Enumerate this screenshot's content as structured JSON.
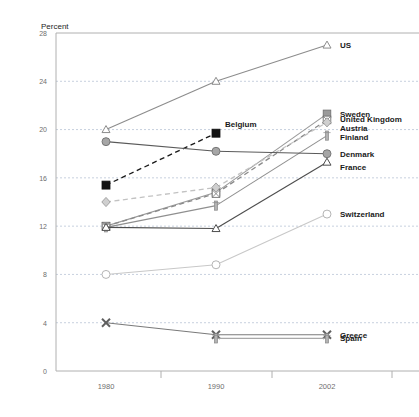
{
  "chart_data": {
    "type": "line",
    "title": "",
    "subtitle": "",
    "xlabel": "",
    "ylabel": "Percent",
    "ylabel_text": "Percent",
    "x": [
      "1980",
      "1990",
      "2002"
    ],
    "categories": [
      "1980",
      "1990",
      "2002"
    ],
    "xtick_labels": [
      "1980",
      "1990",
      "2002"
    ],
    "ytick_labels": [
      "0",
      "4",
      "8",
      "12",
      "16",
      "20",
      "24",
      "28"
    ],
    "ytick_values": [
      0,
      4,
      8,
      12,
      16,
      20,
      24,
      28
    ],
    "ylim": [
      0,
      28
    ],
    "grid": "horizontal-dashed",
    "legend_position": "right-inline",
    "series": [
      {
        "name": "US",
        "label": "US",
        "values": [
          20.0,
          24.0,
          27.0
        ],
        "marker": "triangle-open",
        "line_style": "solid",
        "color": "#8c8c8c",
        "label_y": 27.0
      },
      {
        "name": "Sweden",
        "label": "Sweden",
        "values": [
          12.0,
          14.8,
          21.3
        ],
        "marker": "square-filled",
        "line_style": "solid",
        "color": "#9a9a9a",
        "label_y": 21.3
      },
      {
        "name": "United Kingdom",
        "label": "United Kingdom",
        "values": [
          12.0,
          14.7,
          20.8
        ],
        "marker": "square-crossed",
        "line_style": "dashed",
        "color": "#8a8a8a",
        "label_y": 20.9
      },
      {
        "name": "Austria",
        "label": "Austria",
        "values": [
          14.0,
          15.2,
          20.6
        ],
        "marker": "diamond",
        "line_style": "dashed",
        "color": "#c2c2c2",
        "label_y": 20.0
      },
      {
        "name": "Finland",
        "label": "Finland",
        "values": [
          11.9,
          13.7,
          19.5
        ],
        "marker": "bar",
        "line_style": "solid",
        "color": "#8f8f8f",
        "label_y": 19.4
      },
      {
        "name": "Belgium",
        "label": "Belgium",
        "values": [
          15.4,
          19.7,
          null
        ],
        "marker": "square-black",
        "line_style": "dashed",
        "color": "#1a1a1a",
        "label_y": 20.4,
        "inline_annotation": true
      },
      {
        "name": "Denmark",
        "label": "Denmark",
        "values": [
          19.0,
          18.2,
          18.0
        ],
        "marker": "circle-filled",
        "line_style": "solid",
        "color": "#5a5a5a",
        "label_y": 18.0
      },
      {
        "name": "France",
        "label": "France",
        "values": [
          11.9,
          11.8,
          17.3
        ],
        "marker": "triangle-open",
        "line_style": "solid",
        "color": "#4d4d4d",
        "label_y": 16.9
      },
      {
        "name": "Switzerland",
        "label": "Switzerland",
        "values": [
          8.0,
          8.8,
          13.0
        ],
        "marker": "circle-open",
        "line_style": "solid",
        "color": "#c8c8c8",
        "label_y": 13.0
      },
      {
        "name": "Greece",
        "label": "Greece",
        "values": [
          4.0,
          3.0,
          3.0
        ],
        "marker": "x-cross",
        "line_style": "solid",
        "color": "#7a7a7a",
        "label_y": 3.0
      },
      {
        "name": "Spain",
        "label": "Spain",
        "values": [
          null,
          2.7,
          2.7
        ],
        "marker": "bar",
        "line_style": "solid",
        "color": "#a8a8a8",
        "label_y": 2.7
      }
    ],
    "annotations": [
      {
        "text": "Belgium",
        "series": "Belgium",
        "x": "1990",
        "y": 19.7
      }
    ]
  },
  "colors": {
    "background": "#ffffff",
    "axis": "#b0b0b0",
    "grid": "#b9c4d6",
    "tick_text": "#6e6e6e",
    "label_text": "#1a1a1a"
  }
}
